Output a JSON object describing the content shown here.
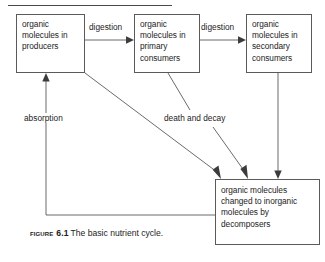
{
  "figure": {
    "caption_label": "Figure",
    "caption_number": "6.1",
    "caption_text": "The basic nutrient cycle."
  },
  "nodes": [
    {
      "id": "producers",
      "text": "organic molecules in producers"
    },
    {
      "id": "primary",
      "text": "organic molecules in primary consumers"
    },
    {
      "id": "secondary",
      "text": "organic molecules in secondary consumers"
    },
    {
      "id": "decomposers",
      "text": "organic molecules changed to inorganic molecules by decomposers"
    }
  ],
  "edges": [
    {
      "id": "digestion-1",
      "label": "digestion",
      "from": "producers",
      "to": "primary"
    },
    {
      "id": "digestion-2",
      "label": "digestion",
      "from": "primary",
      "to": "secondary"
    },
    {
      "id": "death-decay",
      "label": "death and decay",
      "from": "primary",
      "to": "decomposers"
    },
    {
      "id": "absorption",
      "label": "absorption",
      "from": "decomposers",
      "to": "producers"
    }
  ],
  "colors": {
    "box_border": "#5a5a5a",
    "connector": "#6b6b6b",
    "arrowhead": "#3c3c3c",
    "text": "#1c1c1c",
    "rule": "#4a4a4a",
    "background": "#ffffff"
  }
}
